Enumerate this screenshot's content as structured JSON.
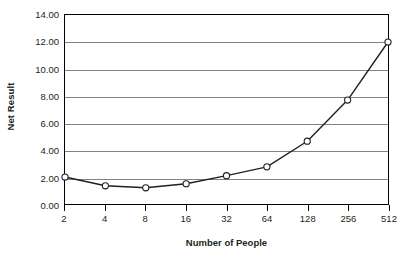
{
  "chart_data": {
    "type": "line",
    "title": "",
    "xlabel": "Number of People",
    "ylabel": "Net Result",
    "categories": [
      "2",
      "4",
      "8",
      "16",
      "32",
      "64",
      "128",
      "256",
      "512"
    ],
    "values": [
      2.0,
      1.35,
      1.2,
      1.5,
      2.1,
      2.75,
      4.65,
      7.7,
      12.0
    ],
    "series": [
      {
        "name": "Net Result",
        "values": [
          2.0,
          1.35,
          1.2,
          1.5,
          2.1,
          2.75,
          4.65,
          7.7,
          12.0
        ]
      }
    ],
    "ylim": [
      0,
      14
    ],
    "ytick_values": [
      0,
      2,
      4,
      6,
      8,
      10,
      12,
      14
    ],
    "ytick_labels": [
      "0.00",
      "2.00",
      "4.00",
      "6.00",
      "8.00",
      "10.00",
      "12.00",
      "14.00"
    ],
    "grid": "horizontal",
    "legend": "none",
    "line_color": "#231f20",
    "marker_fill": "#ffffff",
    "marker_edge": "#231f20",
    "gridline_color": "#808285",
    "axis_color": "#000000",
    "background_color": "#ffffff"
  }
}
